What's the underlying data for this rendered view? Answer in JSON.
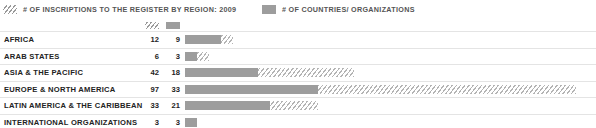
{
  "legend": {
    "items": [
      {
        "swatch": "hatch-swatch",
        "label": "# OF INSCRIPTIONS TO THE REGISTER BY REGION: 2009"
      },
      {
        "swatch": "solid-swatch",
        "label": "# OF COUNTRIES/ ORGANIZATIONS"
      }
    ]
  },
  "colors": {
    "hatch_line": "#b4b4b4",
    "solid_bar": "#9d9d9d",
    "row_divider": "#e4e4e4",
    "label_text": "#232323",
    "legend_text": "#555555",
    "background": "#ffffff"
  },
  "rows": [
    {
      "label": "AFRICA",
      "inscriptions": "12",
      "countries": "9"
    },
    {
      "label": "ARAB STATES",
      "inscriptions": "6",
      "countries": "3"
    },
    {
      "label": "ASIA & THE PACIFIC",
      "inscriptions": "42",
      "countries": "18"
    },
    {
      "label": "EUROPE & NORTH AMERICA",
      "inscriptions": "97",
      "countries": "33"
    },
    {
      "label": "LATIN AMERICA & THE CARIBBEAN",
      "inscriptions": "33",
      "countries": "21"
    },
    {
      "label": "INTERNATIONAL ORGANIZATIONS",
      "inscriptions": "3",
      "countries": "3"
    }
  ],
  "chart_data": {
    "type": "bar",
    "orientation": "horizontal",
    "title": "# OF INSCRIPTIONS TO THE REGISTER BY REGION: 2009",
    "xlabel": "",
    "ylabel": "",
    "grid": false,
    "legend_position": "top",
    "xlim": [
      0,
      97
    ],
    "categories": [
      "AFRICA",
      "ARAB STATES",
      "ASIA & THE PACIFIC",
      "EUROPE & NORTH AMERICA",
      "LATIN AMERICA & THE CARIBBEAN",
      "INTERNATIONAL ORGANIZATIONS"
    ],
    "series": [
      {
        "name": "# OF INSCRIPTIONS TO THE REGISTER BY REGION: 2009",
        "style": "hatched",
        "values": [
          12,
          6,
          42,
          97,
          33,
          3
        ]
      },
      {
        "name": "# OF COUNTRIES/ ORGANIZATIONS",
        "style": "solid",
        "values": [
          9,
          3,
          18,
          33,
          21,
          3
        ]
      }
    ]
  }
}
